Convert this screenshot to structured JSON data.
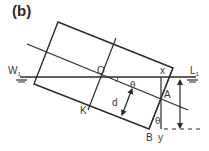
{
  "figure": {
    "panel_label": "(b)",
    "colors": {
      "line": "#2b2b2b",
      "text": "#3a3a3a",
      "background": "#ffffff"
    },
    "labels": {
      "water_left": "W",
      "water_left_sub": "1",
      "water_right": "L",
      "water_right_sub": "1",
      "center": "O",
      "point_x": "x",
      "point_a": "A",
      "point_k": "K",
      "point_b": "B",
      "point_y": "y",
      "thickness": "d",
      "angle_top": "θ",
      "angle_bottom": "θ"
    }
  }
}
